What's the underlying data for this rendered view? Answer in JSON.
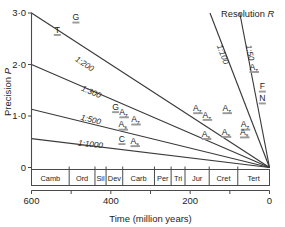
{
  "chart_data": {
    "type": "line",
    "title": "",
    "xlabel": "Time (million years)",
    "ylabel": "Precision P",
    "xlim": [
      600,
      0
    ],
    "ylim": [
      0,
      3.0
    ],
    "xticks": [
      600,
      400,
      200,
      0
    ],
    "xtick_labels": [
      "600",
      "400",
      "200",
      "0"
    ],
    "xminorticks": [
      500,
      300,
      100
    ],
    "yticks": [
      0,
      1.0,
      2.0,
      3.0
    ],
    "ytick_labels": [
      "0",
      "1·0",
      "2·0",
      "3·0"
    ],
    "grid": false,
    "legend_position": "none",
    "annotation_resolution": "Resolution R",
    "series": [
      {
        "name": "1:50",
        "label": "1:50",
        "x": [
          75,
          0
        ],
        "y": [
          3.0,
          0.0
        ]
      },
      {
        "name": "1:100",
        "label": "1:100",
        "x": [
          150,
          0
        ],
        "y": [
          3.0,
          0.0
        ]
      },
      {
        "name": "1:200",
        "label": "1:200",
        "x": [
          600,
          0
        ],
        "y": [
          3.0,
          0.0
        ]
      },
      {
        "name": "1:300",
        "label": "1:300",
        "x": [
          600,
          0
        ],
        "y": [
          2.0,
          0.0
        ]
      },
      {
        "name": "1:500",
        "label": "1:500",
        "x": [
          600,
          0
        ],
        "y": [
          1.13,
          0.0
        ]
      },
      {
        "name": "1:1000",
        "label": "1:1000",
        "x": [
          600,
          0
        ],
        "y": [
          0.56,
          0.0
        ]
      }
    ],
    "data_points": [
      {
        "id": "T",
        "letter": "T",
        "sub": "",
        "x": 535,
        "y": 2.62
      },
      {
        "id": "G1",
        "letter": "G",
        "sub": "",
        "x": 488,
        "y": 2.86
      },
      {
        "id": "G2",
        "letter": "G",
        "sub": "",
        "x": 388,
        "y": 1.12
      },
      {
        "id": "Az1",
        "letter": "A",
        "sub": "z",
        "x": 368,
        "y": 1.02
      },
      {
        "id": "As1",
        "letter": "A",
        "sub": "s",
        "x": 370,
        "y": 0.78
      },
      {
        "id": "Az2",
        "letter": "A",
        "sub": "z",
        "x": 338,
        "y": 0.88
      },
      {
        "id": "C",
        "letter": "C",
        "sub": "",
        "x": 372,
        "y": 0.5
      },
      {
        "id": "As2",
        "letter": "A",
        "sub": "s",
        "x": 340,
        "y": 0.46
      },
      {
        "id": "Az3",
        "letter": "A",
        "sub": "z",
        "x": 182,
        "y": 1.1
      },
      {
        "id": "Az4",
        "letter": "A",
        "sub": "z",
        "x": 158,
        "y": 0.97
      },
      {
        "id": "As3",
        "letter": "A",
        "sub": "s",
        "x": 160,
        "y": 0.6
      },
      {
        "id": "Az5",
        "letter": "A",
        "sub": "z",
        "x": 108,
        "y": 1.1
      },
      {
        "id": "As4",
        "letter": "A",
        "sub": "s",
        "x": 110,
        "y": 0.64
      },
      {
        "id": "Az6",
        "letter": "A",
        "sub": "z",
        "x": 62,
        "y": 0.78
      },
      {
        "id": "As5",
        "letter": "A",
        "sub": "s",
        "x": 64,
        "y": 0.63
      },
      {
        "id": "Az7",
        "letter": "A",
        "sub": "z",
        "x": 40,
        "y": 1.9
      },
      {
        "id": "F",
        "letter": "F",
        "sub": "",
        "x": 18,
        "y": 1.52
      },
      {
        "id": "N",
        "letter": "N",
        "sub": "",
        "x": 18,
        "y": 1.29
      }
    ],
    "geologic_periods": [
      {
        "label": "Camb",
        "start": 600,
        "end": 505
      },
      {
        "label": "Ord",
        "start": 505,
        "end": 440
      },
      {
        "label": "Sil",
        "start": 440,
        "end": 412
      },
      {
        "label": "Dev",
        "start": 412,
        "end": 370
      },
      {
        "label": "Carb",
        "start": 370,
        "end": 290
      },
      {
        "label": "Per",
        "start": 290,
        "end": 248
      },
      {
        "label": "Tri",
        "start": 248,
        "end": 213
      },
      {
        "label": "Jur",
        "start": 213,
        "end": 152
      },
      {
        "label": "Cret",
        "start": 152,
        "end": 80
      },
      {
        "label": "Tert",
        "start": 80,
        "end": 0
      }
    ],
    "colors": {
      "line": "#3a3a3a",
      "axis": "#4a4a4a",
      "text": "#1d1d1d",
      "marker_bar": "#9a9a9a"
    }
  }
}
